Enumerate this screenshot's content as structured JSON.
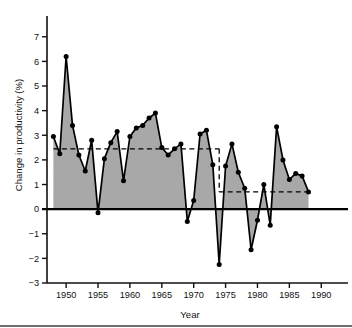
{
  "chart_data": {
    "type": "area",
    "title": "",
    "xlabel": "Year",
    "ylabel": "Change in productivity (%)",
    "xlim": [
      1947,
      1992
    ],
    "ylim": [
      -3,
      7.6
    ],
    "xticks": [
      1950,
      1955,
      1960,
      1965,
      1970,
      1975,
      1980,
      1985,
      1990
    ],
    "yticks": [
      -3,
      -2,
      -1,
      0,
      1,
      2,
      3,
      4,
      5,
      6,
      7
    ],
    "xtick_labels": [
      "1950",
      "1955",
      "1960",
      "1965",
      "1970",
      "1975",
      "1980",
      "1985",
      "1990"
    ],
    "ytick_labels": [
      "−3",
      "−2",
      "−1",
      "0",
      "1",
      "2",
      "3",
      "4",
      "5",
      "6",
      "7"
    ],
    "grid": false,
    "legend": null,
    "series": [
      {
        "name": "Change in productivity",
        "x": [
          1948,
          1949,
          1950,
          1951,
          1952,
          1953,
          1954,
          1955,
          1956,
          1957,
          1958,
          1959,
          1960,
          1961,
          1962,
          1963,
          1964,
          1965,
          1966,
          1967,
          1968,
          1969,
          1970,
          1971,
          1972,
          1973,
          1974,
          1975,
          1976,
          1977,
          1978,
          1979,
          1980,
          1981,
          1982,
          1983,
          1984,
          1985,
          1986,
          1987,
          1988
        ],
        "values": [
          2.95,
          2.25,
          6.2,
          3.4,
          2.2,
          1.55,
          2.8,
          -0.15,
          2.05,
          2.7,
          3.15,
          1.15,
          2.95,
          3.3,
          3.4,
          3.7,
          3.9,
          2.5,
          2.2,
          2.45,
          2.65,
          -0.5,
          0.35,
          3.05,
          3.2,
          1.8,
          -2.25,
          1.75,
          2.65,
          1.5,
          0.85,
          -1.65,
          -0.45,
          1.0,
          -0.65,
          3.35,
          2.0,
          1.2,
          1.45,
          1.35,
          0.7
        ]
      }
    ],
    "reference_lines": [
      {
        "label": "pre-1974 average",
        "value": 2.45,
        "x_start": 1948,
        "x_end": 1974,
        "style": "dashed"
      },
      {
        "label": "post-1974 average",
        "value": 0.7,
        "x_start": 1974,
        "x_end": 1988,
        "style": "dashed"
      },
      {
        "label": "break connector",
        "x": 1974,
        "y_start": 2.45,
        "y_end": 0.7,
        "style": "dashed"
      }
    ],
    "colors": {
      "area_fill": "#a8a8a8",
      "line": "#000000",
      "marker": "#000000",
      "axis": "#111111",
      "reference": "#000000"
    }
  }
}
